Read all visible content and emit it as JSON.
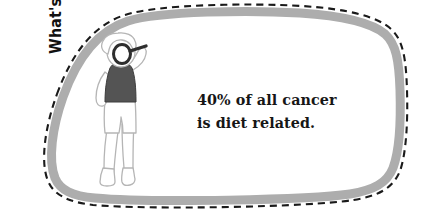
{
  "callout": {
    "name": "whats-the-dirt-callout",
    "heading": "What's the Dirt?",
    "fact_lines": [
      "40% of all cancer",
      "is diet related."
    ],
    "colors": {
      "border_gray": "#adadad",
      "outline_dashed": "#1a1a1a",
      "fill": "#ffffff",
      "heading_text": "#111111",
      "fact_text": "#161616",
      "shirt_gray": "#545454",
      "line_art": "#b5b5b5"
    }
  },
  "illustration": {
    "name": "person-with-magnifying-glass",
    "description": "Person holding magnifying glass to eye",
    "parts": {
      "hair": "hair",
      "head": "head",
      "magnifier": "magnifying-glass",
      "tank_top": "tank-top",
      "shorts": "shorts",
      "legs": "legs",
      "feet": "feet",
      "arm": "arm"
    }
  }
}
